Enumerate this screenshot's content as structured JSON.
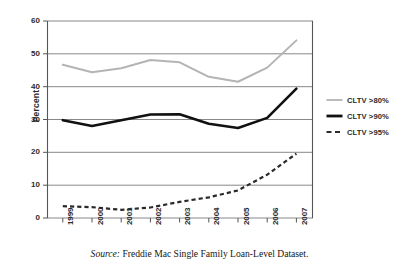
{
  "chart_data": {
    "type": "line",
    "title": "",
    "xlabel": "",
    "ylabel": "Percent",
    "categories": [
      "1999",
      "2000",
      "2001",
      "2002",
      "2003",
      "2004",
      "2005",
      "2006",
      "2007"
    ],
    "x": [
      1999,
      2000,
      2001,
      2002,
      2003,
      2004,
      2005,
      2006,
      2007
    ],
    "ylim": [
      0,
      60
    ],
    "yticks": [
      0,
      10,
      20,
      30,
      40,
      50,
      60
    ],
    "ytick_labels": [
      "0",
      "10",
      "20",
      "30",
      "40",
      "50",
      "60"
    ],
    "grid": "horizontal",
    "legend_position": "right",
    "series": [
      {
        "name": "CLTV >80%",
        "style": "solid-thin",
        "color": "#b4b4b4",
        "values": [
          46.7,
          44.4,
          45.6,
          48.1,
          47.4,
          43.0,
          41.5,
          45.8,
          54.1
        ]
      },
      {
        "name": "CLTV >90%",
        "style": "solid-thick",
        "color": "#111111",
        "values": [
          29.8,
          28.0,
          29.8,
          31.5,
          31.6,
          28.7,
          27.4,
          30.5,
          39.4
        ]
      },
      {
        "name": "CLTV >95%",
        "style": "dashed",
        "color": "#2a2a2a",
        "values": [
          3.6,
          3.3,
          2.5,
          3.2,
          4.9,
          6.3,
          8.4,
          13.2,
          19.6
        ]
      }
    ]
  },
  "legend": {
    "items": [
      {
        "label": "CLTV >80%"
      },
      {
        "label": "CLTV >90%"
      },
      {
        "label": "CLTV >95%"
      }
    ]
  },
  "axes": {
    "y_title": "Percent",
    "y_tick_labels": [
      "60",
      "50",
      "40",
      "30",
      "20",
      "10",
      "0"
    ],
    "x_tick_labels": [
      "1999",
      "2000",
      "2001",
      "2002",
      "2003",
      "2004",
      "2005",
      "2006",
      "2007"
    ]
  },
  "caption": {
    "source_word": "Source:",
    "source_text": " Freddie Mac Single Family Loan-Level Dataset."
  },
  "colors": {
    "series_80": "#b4b4b4",
    "series_90": "#111111",
    "series_95": "#2a2a2a",
    "grid": "#7a7a7a",
    "axis": "#555555",
    "text": "#2b2b2b"
  }
}
